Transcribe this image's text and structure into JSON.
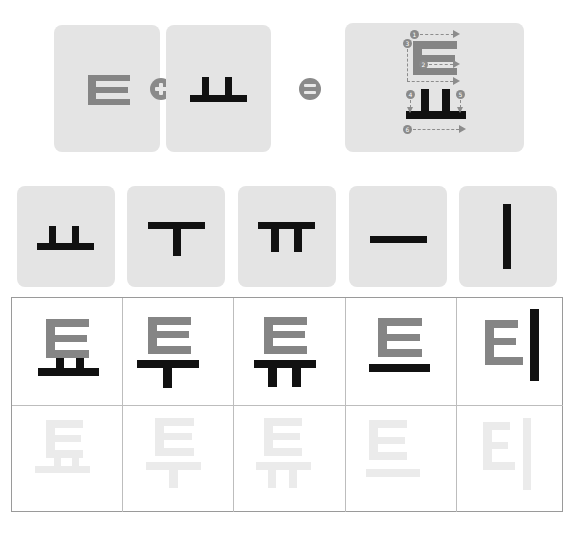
{
  "equation": {
    "consonant": "ㅌ",
    "vowel": "ㅛ",
    "operator_plus": "+",
    "operator_equals": "=",
    "result": "툐",
    "stroke_order": [
      "1",
      "2",
      "3",
      "4",
      "5",
      "6"
    ]
  },
  "vowel_cards": [
    {
      "label": "ㅛ"
    },
    {
      "label": "ㅜ"
    },
    {
      "label": "ㅠ"
    },
    {
      "label": "ㅡ"
    },
    {
      "label": "ㅣ"
    }
  ],
  "practice_grid": {
    "syllables": [
      "툐",
      "투",
      "튜",
      "트",
      "티"
    ],
    "trace_syllables": [
      "툐",
      "투",
      "튜",
      "트",
      "티"
    ]
  },
  "colors": {
    "card_bg": "#e4e4e4",
    "consonant_gray": "#858585",
    "vowel_black": "#111111",
    "trace_light": "#ebebeb",
    "grid_line": "#9a9a9a"
  }
}
